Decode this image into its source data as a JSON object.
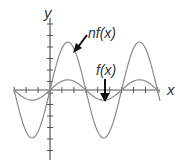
{
  "figure": {
    "axis_labels": {
      "x": "x",
      "y": "y"
    },
    "curve_labels": {
      "scaled": "nf(x)",
      "base": "f(x)"
    },
    "colors": {
      "axes": "#555555",
      "curves": "#8a8a8a",
      "arrows": "#111111",
      "text": "#333333"
    }
  },
  "chart_data": {
    "type": "line",
    "title": "",
    "xlabel": "x",
    "ylabel": "y",
    "grid": false,
    "x_zero_crossings_in_half_periods": [
      -1,
      0,
      1,
      2,
      3
    ],
    "series": [
      {
        "name": "f(x)",
        "relative_amplitude": 1,
        "label_position": "below-right, arrow pointing down to trough"
      },
      {
        "name": "nf(x)",
        "relative_amplitude": 4,
        "label_position": "upper-right, arrow pointing to first peak"
      }
    ],
    "ticks_per_half_period": 3
  }
}
